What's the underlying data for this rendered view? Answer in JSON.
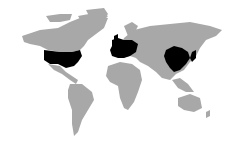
{
  "map": {
    "type": "world-choropleth",
    "colors": {
      "background": "#ffffff",
      "land": "#a8a8a8",
      "highlighted": "#000000"
    },
    "highlighted_regions": [
      "United States",
      "Western Europe",
      "China",
      "Japan",
      "South Korea"
    ]
  }
}
